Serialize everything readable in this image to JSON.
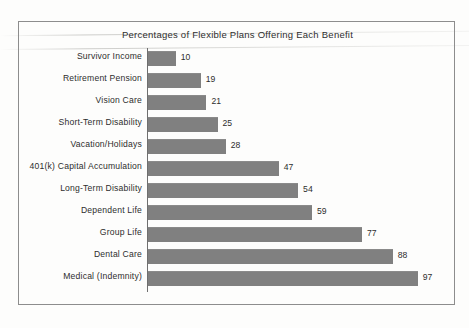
{
  "figure": {
    "title": "Percentages of Flexible Plans Offering Each Benefit"
  },
  "chart_data": {
    "type": "bar",
    "orientation": "horizontal",
    "title": "Percentages of Flexible Plans Offering Each Benefit",
    "xlabel": "",
    "ylabel": "",
    "xlim": [
      0,
      100
    ],
    "grid": false,
    "legend": null,
    "bar_color": "#808080",
    "axis_color": "#6f6f6f",
    "frame_color": "#8d8d8d",
    "value_labels": true,
    "categories": [
      "Survivor Income",
      "Retirement Pension",
      "Vision Care",
      "Short-Term Disability",
      "Vacation/Holidays",
      "401(k) Capital Accumulation",
      "Long-Term Disability",
      "Dependent Life",
      "Group Life",
      "Dental Care",
      "Medical (Indemnity)"
    ],
    "values": [
      10,
      19,
      21,
      25,
      28,
      47,
      54,
      59,
      77,
      88,
      97
    ]
  }
}
